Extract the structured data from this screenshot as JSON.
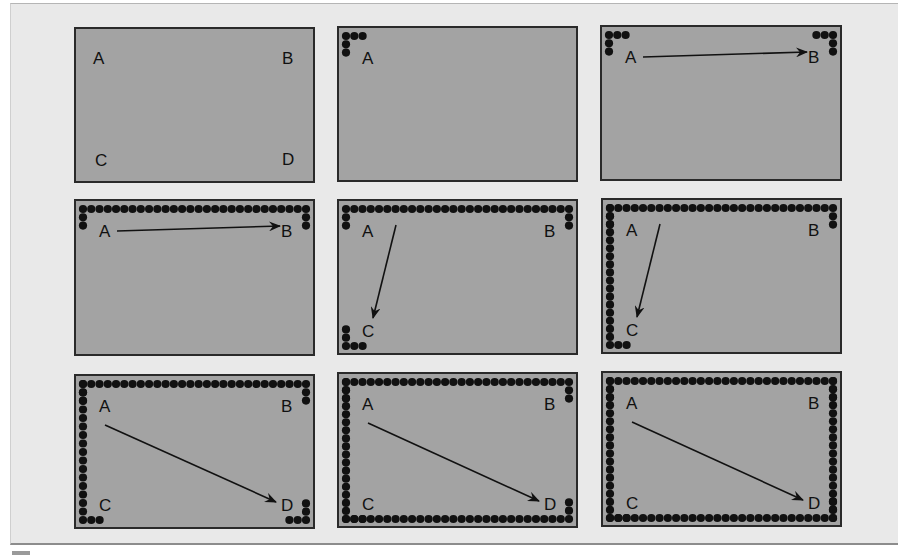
{
  "figure": {
    "colors": {
      "page_background": "#e9e9e9",
      "panel_fill": "#a3a3a3",
      "panel_border": "#2a2a2a",
      "dot": "#111111",
      "text": "#111111"
    },
    "corner_labels": [
      "A",
      "B",
      "C",
      "D"
    ],
    "panels": [
      {
        "index": 1,
        "x": 75,
        "y": 28,
        "w": 239,
        "h": 154,
        "labels": [
          "A",
          "B",
          "C",
          "D"
        ],
        "dots": "none",
        "arrow": null
      },
      {
        "index": 2,
        "x": 338,
        "y": 27,
        "w": 239,
        "h": 154,
        "labels": [
          "A"
        ],
        "dots": "corner-A",
        "arrow": null
      },
      {
        "index": 3,
        "x": 601,
        "y": 26,
        "w": 240,
        "h": 154,
        "labels": [
          "A",
          "B"
        ],
        "dots": "corner-A+corner-B",
        "arrow": "A-B"
      },
      {
        "index": 4,
        "x": 75,
        "y": 200,
        "w": 239,
        "h": 155,
        "labels": [
          "A",
          "B"
        ],
        "dots": "top-row",
        "arrow": "A-B"
      },
      {
        "index": 5,
        "x": 338,
        "y": 200,
        "w": 239,
        "h": 154,
        "labels": [
          "A",
          "B",
          "C"
        ],
        "dots": "top-row+corner-C",
        "arrow": "A-C"
      },
      {
        "index": 6,
        "x": 602,
        "y": 199,
        "w": 239,
        "h": 154,
        "labels": [
          "A",
          "B",
          "C"
        ],
        "dots": "top-row+left-col",
        "arrow": "A-C"
      },
      {
        "index": 7,
        "x": 75,
        "y": 375,
        "w": 239,
        "h": 153,
        "labels": [
          "A",
          "B",
          "C",
          "D"
        ],
        "dots": "top-row+left-col+corner-D",
        "arrow": "A-D"
      },
      {
        "index": 8,
        "x": 338,
        "y": 373,
        "w": 239,
        "h": 154,
        "labels": [
          "A",
          "B",
          "C",
          "D"
        ],
        "dots": "top-row+left-col+bottom-row",
        "arrow": "A-D"
      },
      {
        "index": 9,
        "x": 602,
        "y": 372,
        "w": 239,
        "h": 154,
        "labels": [
          "A",
          "B",
          "C",
          "D"
        ],
        "dots": "full-perimeter",
        "arrow": "A-D"
      }
    ]
  }
}
